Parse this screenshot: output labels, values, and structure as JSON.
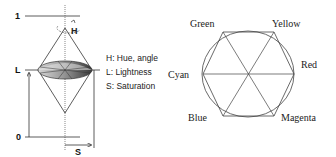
{
  "hsl_model": {
    "axis_top_label": "1",
    "axis_bottom_label": "0",
    "lightness_axis_label": "L",
    "saturation_axis_label": "S",
    "hue_label": "H",
    "legend": [
      {
        "label": "H: Hue, angle"
      },
      {
        "label": "L: Lightness"
      },
      {
        "label": "S: Saturation"
      }
    ]
  },
  "color_hexagon": {
    "vertices": [
      {
        "name": "Green",
        "color": "#00ff00"
      },
      {
        "name": "Yellow",
        "color": "#ffff00"
      },
      {
        "name": "Red",
        "color": "#ff0000"
      },
      {
        "name": "Cyan",
        "color": "#00ffff"
      },
      {
        "name": "Blue",
        "color": "#0000ff"
      },
      {
        "name": "Magenta",
        "color": "#ff00ff"
      }
    ]
  }
}
